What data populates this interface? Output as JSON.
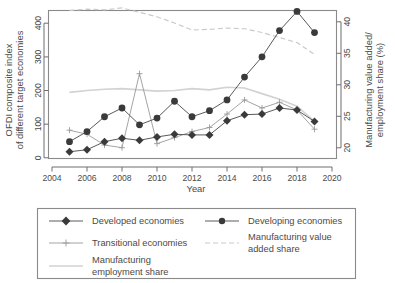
{
  "chart_data": {
    "type": "line",
    "title": "",
    "xlabel": "Year",
    "ylabel": "OFDI composite index\nof different target economies",
    "ylabel_line1": "OFDI composite index",
    "ylabel_line2": "of different target economies",
    "y2label_line1": "Manufacturing value added/",
    "y2label_line2": "employment share (%)",
    "xlim": [
      2004,
      2020
    ],
    "ylim": [
      0,
      440
    ],
    "y2lim": [
      19,
      42.5
    ],
    "grid": false,
    "legend_position": "below-plot",
    "xticks": [
      2004,
      2006,
      2008,
      2010,
      2012,
      2014,
      2016,
      2018,
      2020
    ],
    "yticks": [
      0,
      100,
      200,
      300,
      400
    ],
    "y2ticks": [
      20,
      25,
      30,
      35,
      40
    ],
    "x": [
      2005,
      2006,
      2007,
      2008,
      2009,
      2010,
      2011,
      2012,
      2013,
      2014,
      2015,
      2016,
      2017,
      2018,
      2019
    ],
    "series": [
      {
        "name": "Developed economies",
        "axis": "left",
        "marker": "diamond",
        "style": "solid-dark",
        "values": [
          18,
          24,
          48,
          58,
          52,
          62,
          70,
          68,
          68,
          110,
          128,
          130,
          148,
          142,
          108
        ]
      },
      {
        "name": "Developing economies",
        "axis": "left",
        "marker": "circle",
        "style": "solid-dark",
        "values": [
          48,
          78,
          122,
          148,
          98,
          118,
          168,
          122,
          140,
          172,
          240,
          300,
          378,
          435,
          372
        ]
      },
      {
        "name": "Transitional economies",
        "axis": "left",
        "marker": "plus",
        "style": "solid-light",
        "values": [
          82,
          70,
          38,
          30,
          250,
          42,
          60,
          78,
          90,
          130,
          172,
          148,
          165,
          142,
          85
        ]
      },
      {
        "name": "Manufacturing value added share",
        "axis": "right",
        "marker": "none",
        "style": "dashed-light",
        "values": [
          41.8,
          42.0,
          41.9,
          42.2,
          41.5,
          40.8,
          39.8,
          38.7,
          38.8,
          39.0,
          38.9,
          38.3,
          37.5,
          36.7,
          34.8
        ]
      },
      {
        "name": "Manufacturing employment share",
        "axis": "right",
        "marker": "none",
        "style": "solid-verylight",
        "values": [
          28.8,
          29.1,
          29.3,
          29.4,
          29.2,
          29.0,
          29.1,
          29.4,
          29.2,
          29.6,
          29.5,
          28.6,
          27.7,
          26.6,
          24.2
        ]
      }
    ],
    "annotations": []
  },
  "legend": {
    "entries": [
      {
        "label": "Developed economies",
        "marker": "diamond",
        "style": "solid-dark"
      },
      {
        "label": "Developing economies",
        "marker": "circle",
        "style": "solid-dark"
      },
      {
        "label": "Transitional economies",
        "marker": "plus",
        "style": "solid-light"
      },
      {
        "label": "Manufacturing value added share",
        "label_line1": "Manufacturing value",
        "label_line2": "added share",
        "marker": "none",
        "style": "dashed-light"
      },
      {
        "label": "Manufacturing employment share",
        "label_line1": "Manufacturing",
        "label_line2": "employment share",
        "marker": "none",
        "style": "solid-verylight"
      }
    ]
  },
  "colors": {
    "dark_series": "#3a3a3a",
    "light_series": "#9a9a9a",
    "mva_dashed": "#cacaca",
    "mes_solid": "#d2d2d2",
    "axis": "#6e6e6e",
    "frame": "#8a8a8a",
    "text": "#4a4a4a",
    "background": "#ffffff"
  },
  "axis_tick_labels": {
    "x": [
      "2004",
      "2006",
      "2008",
      "2010",
      "2012",
      "2014",
      "2016",
      "2018",
      "2020"
    ],
    "y_left": [
      "0",
      "100",
      "200",
      "300",
      "400"
    ],
    "y_right": [
      "20",
      "25",
      "30",
      "35",
      "40"
    ]
  }
}
